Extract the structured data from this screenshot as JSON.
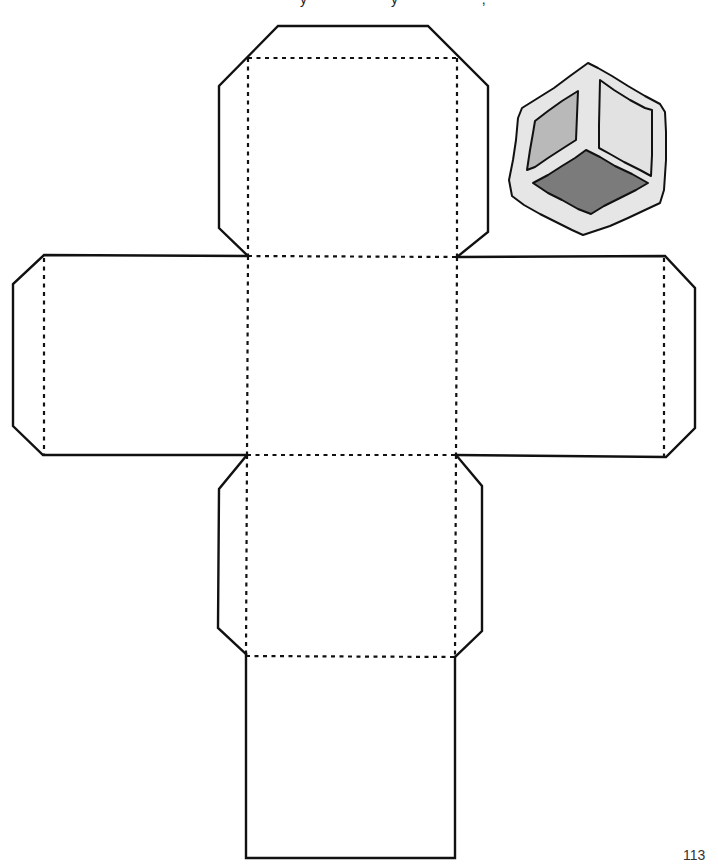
{
  "document": {
    "type": "printable cube net template",
    "header_clipped_text": "y  y  ,",
    "page_number": "113"
  },
  "net": {
    "line_color": "#111111",
    "faces": [
      "top-flap-face",
      "left-face",
      "center-face",
      "right-face",
      "lower-face",
      "bottom-face"
    ],
    "cut_line_style": "solid",
    "fold_line_style": "dashed"
  },
  "cube_illustration": {
    "description": "isometric cube with shaded faces",
    "colors": {
      "body": "#e6e6e6",
      "left_face": "#b9b9b9",
      "right_face": "#e2e2e2",
      "bottom_face": "#7b7b7b",
      "outline": "#111111"
    }
  }
}
